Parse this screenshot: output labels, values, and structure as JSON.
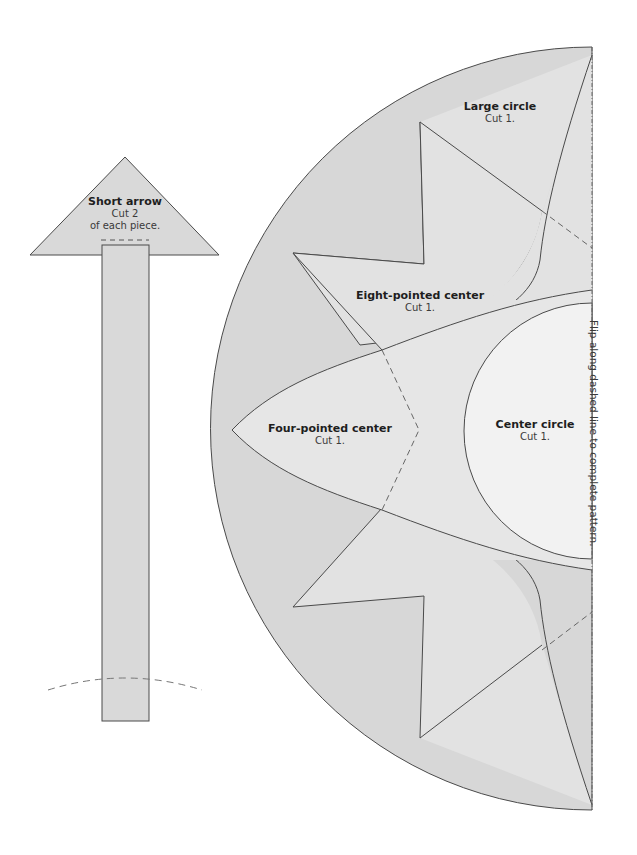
{
  "colors": {
    "background": "#ffffff",
    "fill_medium": "#d7d7d7",
    "fill_light": "#e3e3e3",
    "fill_center": "#f0f0f0",
    "stroke": "#4a4a4a",
    "dash": "#777777"
  },
  "arrow": {
    "title": "Short arrow",
    "line1": "Cut 2",
    "line2": "of each piece."
  },
  "pieces": {
    "large_circle": {
      "title": "Large circle",
      "sub": "Cut 1."
    },
    "eight_pointed": {
      "title": "Eight-pointed center",
      "sub": "Cut 1."
    },
    "four_pointed": {
      "title": "Four-pointed center",
      "sub": "Cut 1."
    },
    "center_circle": {
      "title": "Center circle",
      "sub": "Cut 1."
    }
  },
  "fold_note": "Flip along dashed line to complete pattern."
}
